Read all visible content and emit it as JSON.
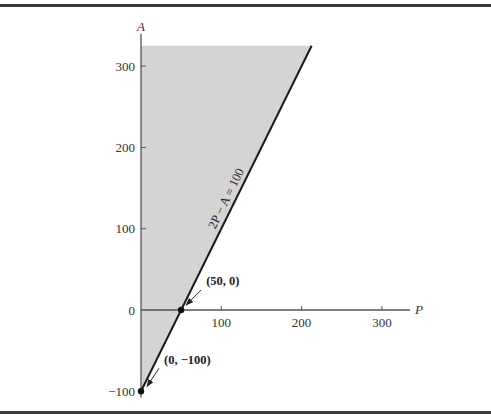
{
  "chart_data": {
    "type": "area",
    "title": "",
    "xlabel": "P",
    "ylabel": "A",
    "xlim": [
      0,
      330
    ],
    "ylim": [
      -110,
      325
    ],
    "x_ticks": [
      0,
      100,
      200,
      300
    ],
    "x_tick_labels": [
      "",
      "100",
      "200",
      "300"
    ],
    "y_ticks": [
      -100,
      0,
      100,
      200,
      300
    ],
    "y_tick_labels": [
      "-100",
      "0",
      "100",
      "200",
      "300"
    ],
    "grid": false,
    "line": {
      "equation_label": "2P − A = 100",
      "points": [
        [
          0,
          -100
        ],
        [
          212.5,
          325
        ]
      ]
    },
    "shaded_region": {
      "description": "P ≥ 0 and 2P − A ≤ 100",
      "vertices": [
        [
          0,
          -100
        ],
        [
          0,
          325
        ],
        [
          212.5,
          325
        ]
      ],
      "fill": "#d4d4d4"
    },
    "annotations": [
      {
        "label": "(50, 0)",
        "point": [
          50,
          0
        ]
      },
      {
        "label": "(0, −100)",
        "point": [
          0,
          -100
        ]
      }
    ]
  },
  "colors": {
    "shade": "#d4d4d4",
    "line": "#1a1a1a",
    "axis": "#555555"
  }
}
